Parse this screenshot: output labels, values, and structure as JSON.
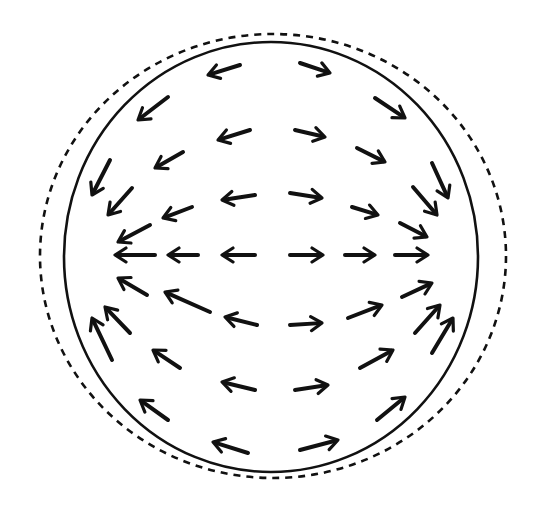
{
  "diagram": {
    "colors": {
      "background": "#ffffff",
      "ink": "#111111"
    },
    "shapes": {
      "solid_circle": {
        "cx": 271,
        "cy": 257,
        "rx": 207,
        "ry": 215,
        "style": "solid"
      },
      "dashed_outline": {
        "cx": 273,
        "cy": 256,
        "rx": 233,
        "ry": 222,
        "style": "dashed"
      }
    },
    "arrows": [
      {
        "id": "tl1",
        "x1": 240,
        "y1": 65,
        "x2": 208,
        "y2": 75
      },
      {
        "id": "tl2",
        "x1": 168,
        "y1": 97,
        "x2": 138,
        "y2": 120
      },
      {
        "id": "tl3",
        "x1": 250,
        "y1": 130,
        "x2": 218,
        "y2": 140
      },
      {
        "id": "tl4",
        "x1": 183,
        "y1": 152,
        "x2": 155,
        "y2": 168
      },
      {
        "id": "tl5",
        "x1": 110,
        "y1": 160,
        "x2": 92,
        "y2": 195
      },
      {
        "id": "tl6",
        "x1": 255,
        "y1": 195,
        "x2": 222,
        "y2": 200
      },
      {
        "id": "tl7",
        "x1": 132,
        "y1": 188,
        "x2": 108,
        "y2": 215
      },
      {
        "id": "tl8",
        "x1": 192,
        "y1": 207,
        "x2": 163,
        "y2": 218
      },
      {
        "id": "tl9",
        "x1": 150,
        "y1": 225,
        "x2": 118,
        "y2": 242
      },
      {
        "id": "tr1",
        "x1": 300,
        "y1": 63,
        "x2": 330,
        "y2": 73
      },
      {
        "id": "tr2",
        "x1": 375,
        "y1": 98,
        "x2": 405,
        "y2": 118
      },
      {
        "id": "tr3",
        "x1": 295,
        "y1": 130,
        "x2": 325,
        "y2": 137
      },
      {
        "id": "tr4",
        "x1": 357,
        "y1": 148,
        "x2": 385,
        "y2": 162
      },
      {
        "id": "tr5",
        "x1": 432,
        "y1": 163,
        "x2": 448,
        "y2": 198
      },
      {
        "id": "tr6",
        "x1": 290,
        "y1": 193,
        "x2": 322,
        "y2": 198
      },
      {
        "id": "tr7",
        "x1": 352,
        "y1": 207,
        "x2": 378,
        "y2": 215
      },
      {
        "id": "tr8",
        "x1": 413,
        "y1": 187,
        "x2": 437,
        "y2": 215
      },
      {
        "id": "tr9",
        "x1": 400,
        "y1": 223,
        "x2": 427,
        "y2": 237
      },
      {
        "id": "ml1",
        "x1": 155,
        "y1": 255,
        "x2": 115,
        "y2": 255
      },
      {
        "id": "ml2",
        "x1": 198,
        "y1": 255,
        "x2": 168,
        "y2": 255
      },
      {
        "id": "ml3",
        "x1": 255,
        "y1": 255,
        "x2": 222,
        "y2": 255
      },
      {
        "id": "mr1",
        "x1": 290,
        "y1": 255,
        "x2": 323,
        "y2": 255
      },
      {
        "id": "mr2",
        "x1": 345,
        "y1": 255,
        "x2": 375,
        "y2": 255
      },
      {
        "id": "mr3",
        "x1": 395,
        "y1": 255,
        "x2": 428,
        "y2": 255
      },
      {
        "id": "bl1",
        "x1": 147,
        "y1": 295,
        "x2": 118,
        "y2": 278
      },
      {
        "id": "bl2",
        "x1": 210,
        "y1": 312,
        "x2": 165,
        "y2": 292
      },
      {
        "id": "bl3",
        "x1": 112,
        "y1": 360,
        "x2": 92,
        "y2": 318
      },
      {
        "id": "bl4",
        "x1": 130,
        "y1": 333,
        "x2": 105,
        "y2": 307
      },
      {
        "id": "bl5",
        "x1": 257,
        "y1": 325,
        "x2": 225,
        "y2": 317
      },
      {
        "id": "bl6",
        "x1": 180,
        "y1": 368,
        "x2": 153,
        "y2": 350
      },
      {
        "id": "bl7",
        "x1": 255,
        "y1": 390,
        "x2": 222,
        "y2": 382
      },
      {
        "id": "bl8",
        "x1": 168,
        "y1": 420,
        "x2": 140,
        "y2": 400
      },
      {
        "id": "bl9",
        "x1": 248,
        "y1": 453,
        "x2": 213,
        "y2": 442
      },
      {
        "id": "br1",
        "x1": 402,
        "y1": 297,
        "x2": 432,
        "y2": 283
      },
      {
        "id": "br2",
        "x1": 348,
        "y1": 318,
        "x2": 382,
        "y2": 305
      },
      {
        "id": "br3",
        "x1": 290,
        "y1": 325,
        "x2": 322,
        "y2": 323
      },
      {
        "id": "br4",
        "x1": 415,
        "y1": 333,
        "x2": 440,
        "y2": 305
      },
      {
        "id": "br5",
        "x1": 432,
        "y1": 353,
        "x2": 453,
        "y2": 318
      },
      {
        "id": "br6",
        "x1": 360,
        "y1": 368,
        "x2": 393,
        "y2": 350
      },
      {
        "id": "br7",
        "x1": 295,
        "y1": 390,
        "x2": 328,
        "y2": 385
      },
      {
        "id": "br8",
        "x1": 377,
        "y1": 420,
        "x2": 405,
        "y2": 397
      },
      {
        "id": "br9",
        "x1": 300,
        "y1": 450,
        "x2": 338,
        "y2": 440
      }
    ]
  }
}
